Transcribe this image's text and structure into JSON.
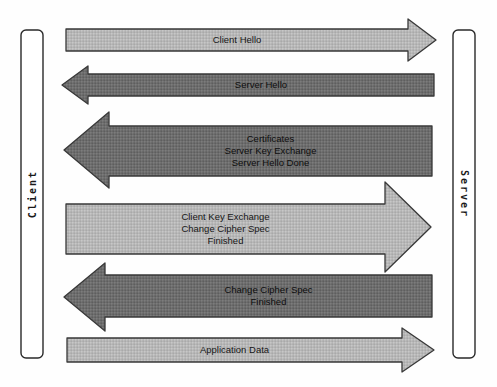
{
  "diagram": {
    "type": "sequence-message-diagram",
    "topic": "TLS handshake between Client and Server",
    "actors": {
      "client": {
        "label": "Client",
        "side": "left"
      },
      "server": {
        "label": "Server",
        "side": "right"
      }
    },
    "messages": [
      {
        "label": "Client Hello",
        "from": "client",
        "to": "server",
        "direction": "right",
        "tone": "light"
      },
      {
        "label": "Server Hello",
        "from": "server",
        "to": "client",
        "direction": "left",
        "tone": "dark"
      },
      {
        "label": "Certificates\nServer Key Exchange\nServer Hello Done",
        "from": "server",
        "to": "client",
        "direction": "left",
        "tone": "dark"
      },
      {
        "label": "Client Key Exchange\nChange Cipher Spec\nFinished",
        "from": "client",
        "to": "server",
        "direction": "right",
        "tone": "light"
      },
      {
        "label": "Change Cipher Spec\nFinished",
        "from": "server",
        "to": "client",
        "direction": "left",
        "tone": "dark"
      },
      {
        "label": "Application Data",
        "from": "client",
        "to": "server",
        "direction": "right",
        "tone": "light"
      }
    ],
    "colors": {
      "light_arrow_fill": "#b7b7b7",
      "dark_arrow_fill": "#6d6d6d",
      "arrow_border": "#383838",
      "bar_fill": "#ffffff",
      "bar_border": "#2a2a2a",
      "label_text": "#161616",
      "background": "#fefefe"
    }
  }
}
